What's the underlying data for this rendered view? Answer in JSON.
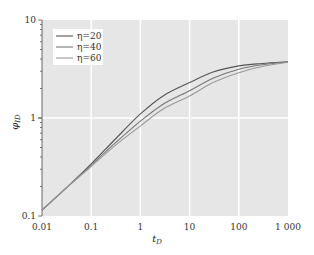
{
  "chart_data": {
    "type": "line",
    "title": "",
    "xlabel": "t_D",
    "ylabel": "φ_ID",
    "xscale": "log",
    "yscale": "log",
    "xlim": [
      0.01,
      1000
    ],
    "ylim": [
      0.1,
      10
    ],
    "x_ticks": [
      "0.01",
      "0.1",
      "1",
      "10",
      "100",
      "1 000"
    ],
    "y_ticks": [
      "0.1",
      "1",
      "10"
    ],
    "grid": true,
    "legend_position": "upper left",
    "x": [
      0.01,
      0.03,
      0.1,
      0.3,
      1,
      3,
      10,
      30,
      100,
      300,
      1000
    ],
    "series": [
      {
        "name": "η=20",
        "color": "#555555",
        "values": [
          0.115,
          0.19,
          0.34,
          0.6,
          1.1,
          1.7,
          2.3,
          2.95,
          3.4,
          3.6,
          3.75
        ]
      },
      {
        "name": "η=40",
        "color": "#777777",
        "values": [
          0.115,
          0.19,
          0.33,
          0.55,
          0.93,
          1.4,
          1.9,
          2.55,
          3.15,
          3.5,
          3.72
        ]
      },
      {
        "name": "η=60",
        "color": "#999999",
        "values": [
          0.115,
          0.19,
          0.32,
          0.52,
          0.83,
          1.25,
          1.68,
          2.3,
          2.9,
          3.35,
          3.7
        ]
      }
    ]
  },
  "labels": {
    "xlabel_main": "t",
    "xlabel_sub": "D",
    "ylabel_main": "φ",
    "ylabel_sub": "ID"
  }
}
